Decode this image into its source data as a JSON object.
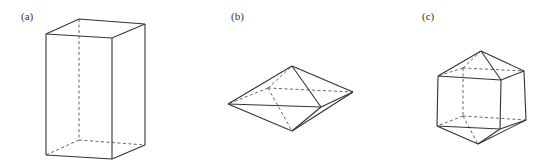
{
  "figure": {
    "panels": [
      {
        "label": "(a)",
        "shape": "rectangular prism (cuboid)"
      },
      {
        "label": "(b)",
        "shape": "octahedron"
      },
      {
        "label": "(c)",
        "shape": "cuboid capped with square pyramids (elongated octahedron)"
      }
    ]
  }
}
